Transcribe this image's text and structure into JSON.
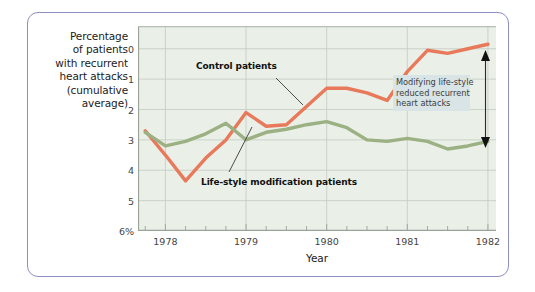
{
  "figure": {
    "frame_color": "#8b8fc4",
    "plot_background": "#eaefe7"
  },
  "axes": {
    "y_title_lines": [
      "Percentage",
      "of patients",
      "with recurrent",
      "heart attacks",
      "(cumulative",
      "average)"
    ],
    "y_ticks": [
      "6%",
      "5",
      "4",
      "3",
      "2",
      "1",
      "0"
    ],
    "y_tick_values": [
      6,
      5,
      4,
      3,
      2,
      1,
      0
    ],
    "x_title": "Year",
    "x_ticks": [
      "1978",
      "1979",
      "1980",
      "1981",
      "1982"
    ],
    "x_tick_values": [
      1978,
      1979,
      1980,
      1981,
      1982
    ]
  },
  "annotations": {
    "control_label": "Control patients",
    "lifestyle_label": "Life-style modification patients",
    "callout_lines": [
      "Modifying life-style",
      "reduced recurrent",
      "heart attacks"
    ],
    "callout_bg": "#d9e4e6",
    "arrow_name": "double-headed-vertical-arrow"
  },
  "chart_data": {
    "type": "line",
    "title": "",
    "subtitle": "",
    "xlabel": "Year",
    "ylabel": "Percentage of patients with recurrent heart attacks (cumulative average)",
    "xlim": [
      1977.66,
      1982.1
    ],
    "ylim": [
      0,
      6.75
    ],
    "grid": true,
    "legend": "inline-labels",
    "x_major_ticks": [
      1978,
      1979,
      1980,
      1981,
      1982
    ],
    "x_minor_tick_interval": 0.25,
    "y_ticks": [
      0,
      1,
      2,
      3,
      4,
      5,
      6
    ],
    "series": [
      {
        "name": "Control patients",
        "color": "#e8795a",
        "x": [
          1977.75,
          1978.0,
          1978.25,
          1978.5,
          1978.75,
          1979.0,
          1979.25,
          1979.5,
          1979.75,
          1980.0,
          1980.25,
          1980.5,
          1980.75,
          1981.0,
          1981.25,
          1981.5,
          1981.75,
          1982.0
        ],
        "values": [
          3.3,
          2.5,
          1.65,
          2.4,
          3.0,
          3.9,
          3.45,
          3.5,
          4.1,
          4.7,
          4.7,
          4.55,
          4.3,
          5.25,
          5.95,
          5.85,
          6.0,
          6.15
        ]
      },
      {
        "name": "Life-style modification patients",
        "color": "#9cb183",
        "x": [
          1977.75,
          1978.0,
          1978.25,
          1978.5,
          1978.75,
          1979.0,
          1979.25,
          1979.5,
          1979.75,
          1980.0,
          1980.25,
          1980.5,
          1980.75,
          1981.0,
          1981.25,
          1981.5,
          1981.75,
          1982.0
        ],
        "values": [
          3.25,
          2.8,
          2.95,
          3.2,
          3.55,
          3.0,
          3.25,
          3.35,
          3.5,
          3.6,
          3.4,
          3.0,
          2.95,
          3.05,
          2.95,
          2.7,
          2.8,
          2.95
        ]
      }
    ]
  }
}
